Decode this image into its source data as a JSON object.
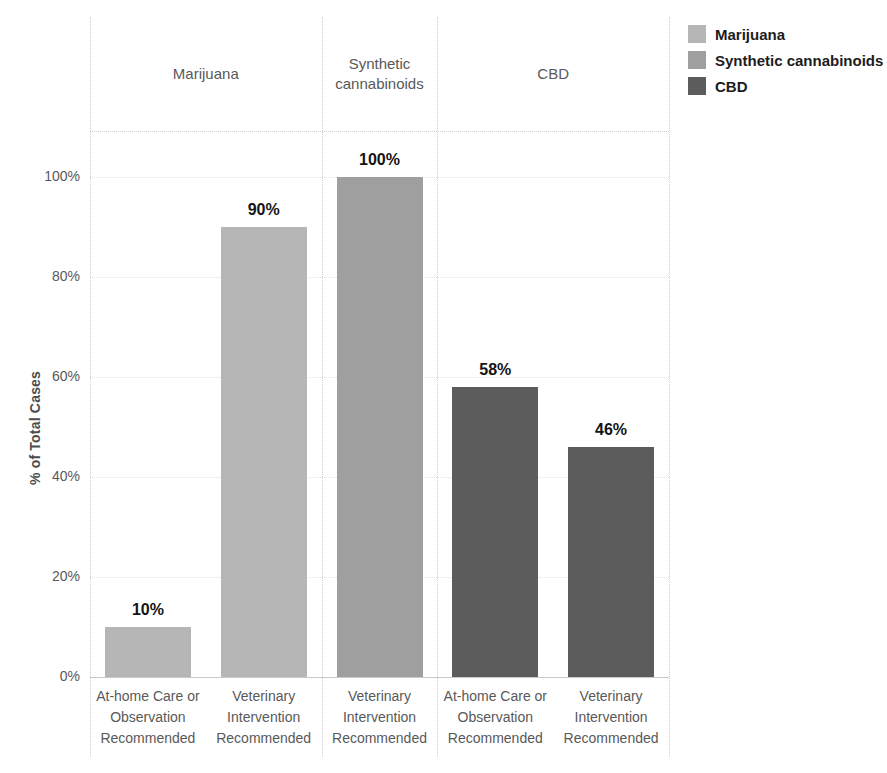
{
  "chart_data": {
    "type": "bar",
    "title": "",
    "ylabel": "% of Total Cases",
    "xlabel": "",
    "ylim": [
      0,
      100
    ],
    "yticks": [
      0,
      20,
      40,
      60,
      80,
      100
    ],
    "ytick_labels": [
      "0%",
      "20%",
      "40%",
      "60%",
      "80%",
      "100%"
    ],
    "grid": "faint dotted horizontal",
    "legend_position": "top-right outside",
    "groups": [
      {
        "name": "Marijuana",
        "color": "#b6b6b6",
        "bars": [
          {
            "category": "At-home Care or Observation Recommended",
            "value": 10,
            "label": "10%"
          },
          {
            "category": "Veterinary Intervention Recommended",
            "value": 90,
            "label": "90%"
          }
        ]
      },
      {
        "name": "Synthetic cannabinoids",
        "color": "#9f9f9f",
        "bars": [
          {
            "category": "Veterinary Intervention Recommended",
            "value": 100,
            "label": "100%"
          }
        ]
      },
      {
        "name": "CBD",
        "color": "#5c5c5c",
        "bars": [
          {
            "category": "At-home Care or Observation Recommended",
            "value": 58,
            "label": "58%"
          },
          {
            "category": "Veterinary Intervention Recommended",
            "value": 46,
            "label": "46%"
          }
        ]
      }
    ],
    "legend": [
      {
        "label": "Marijuana",
        "color": "#b6b6b6"
      },
      {
        "label": "Synthetic cannabinoids",
        "color": "#9f9f9f"
      },
      {
        "label": "CBD",
        "color": "#5c5c5c"
      }
    ]
  }
}
